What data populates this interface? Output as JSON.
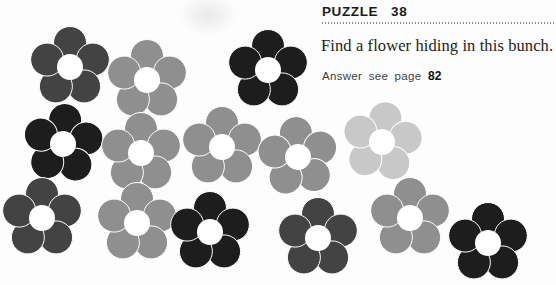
{
  "header": {
    "puzzle_label": "PUZZLE",
    "puzzle_number": "38"
  },
  "instruction": "Find a flower hiding in this bunch.",
  "answer": {
    "prefix": "Answer see page",
    "page": "82"
  },
  "palette": {
    "black": "#1d1d1d",
    "dark_gray": "#434343",
    "gray": "#8f8f8f",
    "light_gray": "#c8c8c8"
  },
  "flower_style": {
    "petal_count": 5,
    "petal_radius": 16.5,
    "petal_offset": 24,
    "center_radius": 13,
    "center_color": "#ffffff"
  },
  "flowers": [
    {
      "x": 70,
      "y": 67,
      "shade": "dark_gray",
      "rot": 0
    },
    {
      "x": 147,
      "y": 80,
      "shade": "gray",
      "rot": 0
    },
    {
      "x": 268,
      "y": 70,
      "shade": "black",
      "rot": 0
    },
    {
      "x": 63,
      "y": 144,
      "shade": "black",
      "rot": 5
    },
    {
      "x": 141,
      "y": 153,
      "shade": "gray",
      "rot": 0
    },
    {
      "x": 222,
      "y": 147,
      "shade": "gray",
      "rot": 0
    },
    {
      "x": 298,
      "y": 157,
      "shade": "gray",
      "rot": -5
    },
    {
      "x": 382,
      "y": 142,
      "shade": "light_gray",
      "rot": 8
    },
    {
      "x": 42,
      "y": 218,
      "shade": "dark_gray",
      "rot": 0
    },
    {
      "x": 137,
      "y": 223,
      "shade": "gray",
      "rot": 0
    },
    {
      "x": 210,
      "y": 232,
      "shade": "black",
      "rot": 0
    },
    {
      "x": 318,
      "y": 238,
      "shade": "dark_gray",
      "rot": 0
    },
    {
      "x": 410,
      "y": 218,
      "shade": "gray",
      "rot": 0
    },
    {
      "x": 488,
      "y": 243,
      "shade": "black",
      "rot": 0
    }
  ]
}
